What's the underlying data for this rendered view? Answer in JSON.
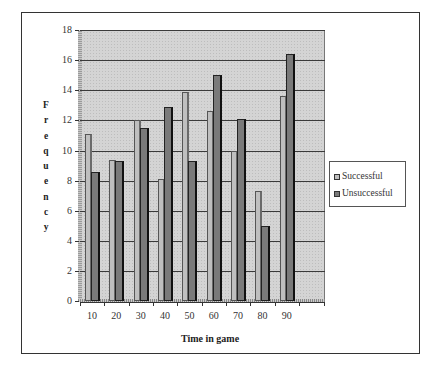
{
  "chart_data": {
    "type": "bar",
    "title": "",
    "xlabel": "Time in game",
    "ylabel": "Frequency",
    "ylim": [
      0,
      18
    ],
    "yticks": [
      0,
      2,
      4,
      6,
      8,
      10,
      12,
      14,
      16,
      18
    ],
    "categories": [
      "10",
      "20",
      "30",
      "40",
      "50",
      "60",
      "70",
      "80",
      "90"
    ],
    "series": [
      {
        "name": "Successful",
        "color": "#bfbfbf",
        "values": [
          11.1,
          9.4,
          12.0,
          8.1,
          13.9,
          12.6,
          10.0,
          7.3,
          13.6
        ]
      },
      {
        "name": "Unsuccessful",
        "color": "#7a7a7a",
        "values": [
          8.6,
          9.3,
          11.5,
          12.9,
          9.3,
          15.0,
          12.1,
          5.0,
          16.4
        ]
      }
    ],
    "grid": true,
    "legend_position": "right",
    "style": "3d-clustered-column"
  },
  "axis": {
    "x_title": "Time in game",
    "y_title_letters": [
      "F",
      "r",
      "e",
      "q",
      "u",
      "e",
      "n",
      "c",
      "y"
    ]
  },
  "legend": {
    "items": [
      {
        "label": "Successful",
        "color": "#bfbfbf"
      },
      {
        "label": "Unsuccessful",
        "color": "#7a7a7a"
      }
    ]
  }
}
